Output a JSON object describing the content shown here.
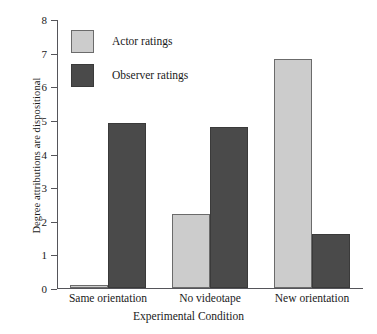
{
  "chart_data": {
    "type": "bar",
    "title": "",
    "subtitle": "",
    "xlabel": "Experimental Condition",
    "ylabel": "Degree attributions are dispositional",
    "categories": [
      "Same orientation",
      "No videotape",
      "New orientation"
    ],
    "series": [
      {
        "name": "Actor ratings",
        "values": [
          0.1,
          2.2,
          6.8
        ],
        "color": "#cccccc"
      },
      {
        "name": "Observer ratings",
        "values": [
          4.9,
          4.8,
          1.6
        ],
        "color": "#4a4a4a"
      }
    ],
    "ylim": [
      0,
      8
    ],
    "yticks": [
      0,
      1,
      2,
      3,
      4,
      5,
      6,
      7,
      8
    ],
    "ytick_labels": [
      "0",
      "1",
      "2",
      "3",
      "4",
      "5",
      "6",
      "7",
      "8"
    ],
    "grid": false,
    "legend_position": "upper left (inside plot)",
    "legend_entries": [
      "Actor ratings",
      "Observer ratings"
    ]
  },
  "legend": {
    "actor_label": "Actor ratings",
    "observer_label": "Observer ratings"
  },
  "axes": {
    "x_title": "Experimental Condition",
    "y_title": "Degree attributions are dispositional"
  }
}
